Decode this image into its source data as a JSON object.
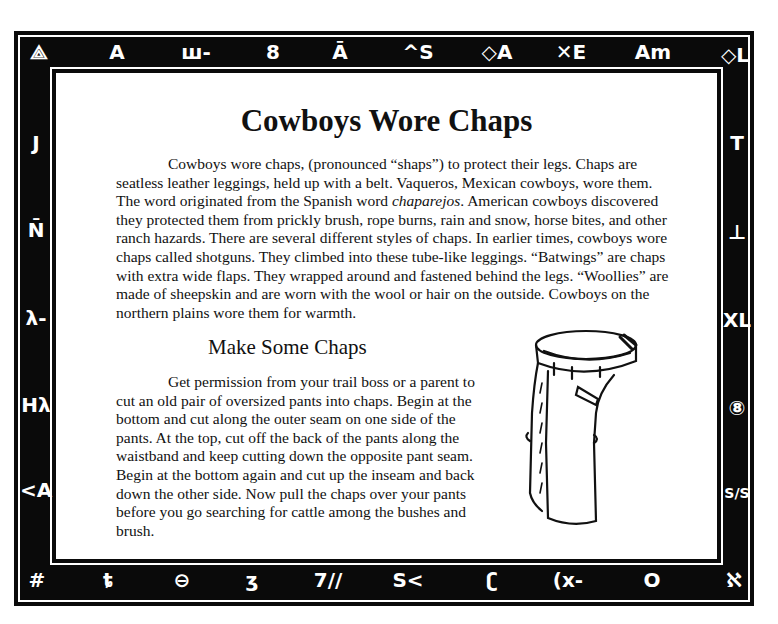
{
  "document": {
    "title": "Cowboys Wore Chaps",
    "intro_paragraph": {
      "before_italic": "Cowboys wore chaps, (pronounced “shaps”) to protect their legs. Chaps are seatless leather leggings, held up with a belt. Vaqueros, Mexican cowboys, wore them. The word originated from the Spanish word ",
      "italic": "chaparejos",
      "after_italic": ". American cowboys discovered they protected them from prickly brush, rope burns, rain and snow, horse bites, and other ranch hazards. There are several different styles of chaps. In earlier times, cowboys wore chaps called shotguns. They climbed into these tube-like leggings. “Batwings” are chaps with extra wide flaps. They wrapped around and fastened behind the legs. “Woollies” are made of sheepskin and are worn with the wool or hair on the outside. Cowboys on the northern plains wore them for warmth."
    },
    "subheading": "Make Some Chaps",
    "instructions_paragraph": "Get permission from your trail boss or a parent to cut an old pair of oversized pants into chaps. Begin at the bottom and cut along the outer seam on one side of the pants. At the top, cut off the back of the pants along the waistband and keep cutting down the opposite pant seam. Begin at the bottom again and cut up the inseam and back down the other side. Now pull the chaps over your pants before you go searching for cattle among the bushes and brush.",
    "illustration": "chaps-drawing"
  },
  "border": {
    "colors": {
      "frame": "#0a0a0a",
      "glyph": "#ffffff"
    },
    "top": [
      "⟁",
      "A",
      "ш-",
      "8",
      "Ā",
      "^S",
      "◇A",
      "✕E",
      "Am",
      "◇L"
    ],
    "left": [
      "J",
      "N̄",
      "λ-",
      "Hλ",
      "<A"
    ],
    "right": [
      "T",
      "⊥",
      "XL",
      "⑧",
      "S/S"
    ],
    "bottom": [
      "#",
      "ȶ",
      "⊖",
      "ʒ",
      "7//",
      "S<",
      "ʗ",
      "(x-",
      "O",
      "ℵ"
    ]
  }
}
